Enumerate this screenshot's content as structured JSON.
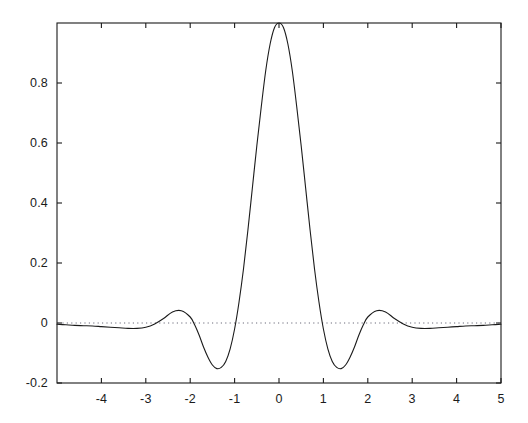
{
  "chart_data": {
    "type": "line",
    "title": "",
    "subtitle": "",
    "xlabel": "",
    "ylabel": "",
    "xlim": [
      -5,
      5
    ],
    "ylim": [
      -0.2,
      1.0
    ],
    "grid": false,
    "legend": null,
    "legend_position": "none",
    "line_color": "#1b1b1b",
    "line_width": 1.1,
    "frame": "box",
    "xticks": [
      -4,
      -3,
      -2,
      -1,
      0,
      1,
      2,
      3,
      4,
      5
    ],
    "xtick_labels": [
      "-4",
      "-3",
      "-2",
      "-1",
      "0",
      "1",
      "2",
      "3",
      "4",
      "5"
    ],
    "yticks": [
      -0.2,
      0,
      0.2,
      0.4,
      0.6,
      0.8
    ],
    "ytick_labels": [
      "-0.2",
      "0",
      "0.2",
      "0.4",
      "0.6",
      "0.8"
    ],
    "annotations": [
      {
        "kind": "zero-reference-line",
        "y": 0,
        "style": "dotted",
        "color": "#6b6b7a"
      }
    ],
    "series": [
      {
        "name": "scaling function",
        "peak_value": 1.0,
        "peak_x": 0,
        "zero_crossings": [
          -1,
          1
        ],
        "local_minima": [
          {
            "x": -1.45,
            "y": -0.152
          },
          {
            "x": 1.45,
            "y": -0.152
          },
          {
            "x": -3.32,
            "y": -0.018
          },
          {
            "x": 3.32,
            "y": -0.018
          }
        ],
        "local_maxima": [
          {
            "x": -2.36,
            "y": 0.042
          },
          {
            "x": 2.36,
            "y": 0.042
          },
          {
            "x": 0,
            "y": 1.0
          }
        ],
        "x": [
          -5.0,
          -4.8,
          -4.6,
          -4.4,
          -4.2,
          -4.0,
          -3.8,
          -3.6,
          -3.4,
          -3.2,
          -3.0,
          -2.8,
          -2.6,
          -2.4,
          -2.2,
          -2.0,
          -1.9,
          -1.8,
          -1.7,
          -1.6,
          -1.5,
          -1.4,
          -1.3,
          -1.2,
          -1.1,
          -1.0,
          -0.9,
          -0.8,
          -0.7,
          -0.6,
          -0.5,
          -0.4,
          -0.3,
          -0.2,
          -0.1,
          0.0,
          0.1,
          0.2,
          0.3,
          0.4,
          0.5,
          0.6,
          0.7,
          0.8,
          0.9,
          1.0,
          1.1,
          1.2,
          1.3,
          1.4,
          1.5,
          1.6,
          1.7,
          1.8,
          1.9,
          2.0,
          2.2,
          2.4,
          2.6,
          2.8,
          3.0,
          3.2,
          3.4,
          3.6,
          3.8,
          4.0,
          4.2,
          4.4,
          4.6,
          4.8,
          5.0
        ],
        "y": [
          -0.004,
          -0.006,
          -0.008,
          -0.009,
          -0.01,
          -0.012,
          -0.014,
          -0.016,
          -0.018,
          -0.018,
          -0.014,
          -0.003,
          0.015,
          0.037,
          0.041,
          0.02,
          -0.006,
          -0.04,
          -0.08,
          -0.114,
          -0.14,
          -0.152,
          -0.148,
          -0.128,
          -0.086,
          -0.02,
          0.07,
          0.18,
          0.31,
          0.45,
          0.59,
          0.72,
          0.84,
          0.93,
          0.985,
          1.0,
          0.985,
          0.93,
          0.84,
          0.72,
          0.59,
          0.45,
          0.31,
          0.18,
          0.07,
          -0.02,
          -0.086,
          -0.128,
          -0.148,
          -0.152,
          -0.14,
          -0.114,
          -0.08,
          -0.04,
          -0.006,
          0.02,
          0.041,
          0.037,
          0.015,
          -0.003,
          -0.014,
          -0.018,
          -0.018,
          -0.016,
          -0.014,
          -0.012,
          -0.01,
          -0.009,
          -0.008,
          -0.006,
          -0.004
        ]
      }
    ]
  },
  "figure": {
    "background_color": "#ffffff",
    "axes_color": "#1b1b1b",
    "plot_left_px": 57,
    "plot_right_px": 501,
    "plot_top_px": 23,
    "plot_bottom_px": 383
  }
}
